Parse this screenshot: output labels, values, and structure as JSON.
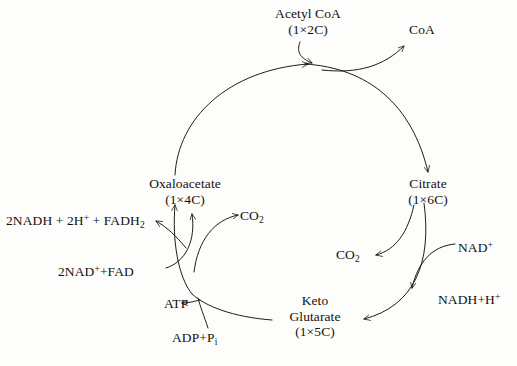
{
  "diagram": {
    "background_color": "#fdfdfb",
    "ink_color": "#14100f",
    "nodes": {
      "acetyl_coa_name": "Acetyl CoA",
      "acetyl_coa_count": "(1×2C)",
      "coa": "CoA",
      "citrate_name": "Citrate",
      "citrate_count": "(1×6C)",
      "oxaloacetate_name": "Oxaloacetate",
      "oxaloacetate_count": "(1×4C)",
      "keto_glutarate_line1": "Keto",
      "keto_glutarate_line2": "Glutarate",
      "keto_glutarate_count": "(1×5C)"
    },
    "cofactors": {
      "products_left": "2NADH + 2H",
      "products_left_sup": "+",
      "products_left_tail": " + FADH",
      "products_left_sub": "2",
      "reactants_left": "2NAD",
      "reactants_left_sup": "+",
      "reactants_left_tail": "+FAD",
      "co2_upper": "CO",
      "co2_upper_sub": "2",
      "co2_right": "CO",
      "co2_right_sub": "2",
      "nad_plus": "NAD",
      "nad_plus_sup": "+",
      "nadh_h": "NADH+H",
      "nadh_h_sup": "+",
      "atp": "ATP",
      "adp_pi": "ADP+P",
      "adp_pi_sub": "i"
    }
  }
}
